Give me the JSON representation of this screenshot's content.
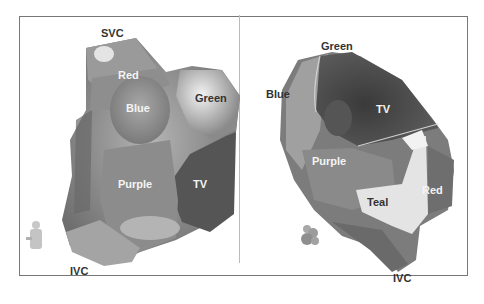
{
  "figure": {
    "border_color": "#777777",
    "left_panel": {
      "view": "left-anterior-oblique",
      "labels": [
        {
          "id": "svc",
          "text": "SVC",
          "tone": "dark"
        },
        {
          "id": "red",
          "text": "Red",
          "tone": "light"
        },
        {
          "id": "blue",
          "text": "Blue",
          "tone": "light"
        },
        {
          "id": "green",
          "text": "Green",
          "tone": "dark"
        },
        {
          "id": "purple",
          "text": "Purple",
          "tone": "light"
        },
        {
          "id": "tv",
          "text": "TV",
          "tone": "light"
        },
        {
          "id": "ivc",
          "text": "IVC",
          "tone": "dark"
        }
      ],
      "orientation_icon": "torso-figure-icon"
    },
    "right_panel": {
      "view": "right-anterior-oblique",
      "labels": [
        {
          "id": "green",
          "text": "Green",
          "tone": "dark"
        },
        {
          "id": "blue",
          "text": "Blue",
          "tone": "dark"
        },
        {
          "id": "tv",
          "text": "TV",
          "tone": "light"
        },
        {
          "id": "purple",
          "text": "Purple",
          "tone": "light"
        },
        {
          "id": "teal",
          "text": "Teal",
          "tone": "dark"
        },
        {
          "id": "red",
          "text": "Red",
          "tone": "light"
        },
        {
          "id": "ivc",
          "text": "IVC",
          "tone": "dark"
        }
      ],
      "orientation_icon": "torso-figure-icon"
    }
  }
}
